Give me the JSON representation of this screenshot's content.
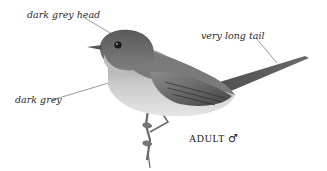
{
  "illustration": {
    "subject": "bird-adult-male",
    "annotations": [
      {
        "id": "head",
        "text": "dark grey head"
      },
      {
        "id": "tail",
        "text": "very long tail"
      },
      {
        "id": "body",
        "text": "dark grey"
      }
    ],
    "caption": {
      "text": "ADULT",
      "sex_symbol": "♂"
    },
    "colors": {
      "background": "#ffffff",
      "head": "#6b6b6b",
      "back": "#7a7a7a",
      "wing_dark": "#3e3e3e",
      "belly": "#d6d6d6",
      "leader_line": "#555555"
    }
  }
}
